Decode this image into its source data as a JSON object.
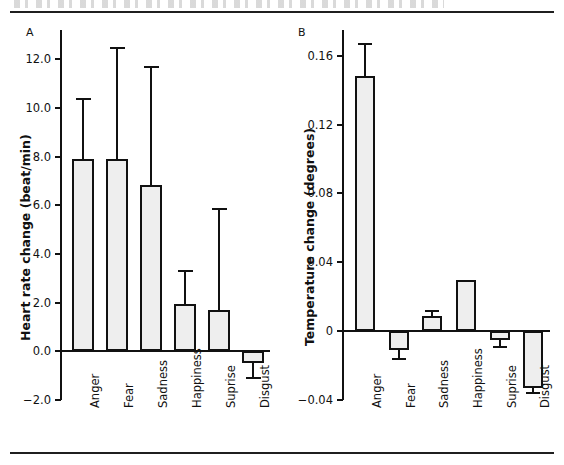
{
  "figure": {
    "panel_a_letter": "A",
    "panel_b_letter": "B"
  },
  "chart_data": [
    {
      "type": "bar",
      "panel": "A",
      "title": "",
      "xlabel": "",
      "ylabel": "Heart rate change (beat/min)",
      "ylim": [
        -2.0,
        13.2
      ],
      "yticks": [
        12.0,
        10.0,
        8.0,
        6.0,
        4.0,
        2.0,
        0.0,
        -2.0
      ],
      "yticklabels": [
        "12.0",
        "10.0",
        "8.0",
        "6.0",
        "4.0",
        "2.0",
        "0.0",
        "−2.0"
      ],
      "grid": false,
      "legend": "none",
      "categories": [
        "Anger",
        "Fear",
        "Sadness",
        "Happiness",
        "Suprise",
        "Disgust"
      ],
      "values": [
        7.9,
        7.9,
        6.85,
        1.95,
        1.7,
        -0.5
      ],
      "error_upper": [
        10.35,
        12.45,
        11.7,
        3.3,
        5.85,
        -0.5
      ],
      "error_lower": [
        7.9,
        7.9,
        6.85,
        1.95,
        1.7,
        -1.1
      ]
    },
    {
      "type": "bar",
      "panel": "B",
      "title": "",
      "xlabel": "",
      "ylabel": "Temperature change (degrees)",
      "ylim": [
        -0.04,
        0.175
      ],
      "yticks": [
        0.16,
        0.12,
        0.08,
        0.04,
        0,
        -0.04
      ],
      "yticklabels": [
        "0.16",
        "0.12",
        "0.08",
        "0.04",
        "0",
        "−0.04"
      ],
      "grid": false,
      "legend": "none",
      "categories": [
        "Anger",
        "Fear",
        "Sadness",
        "Happiness",
        "Suprise",
        "Disgust"
      ],
      "values": [
        0.148,
        -0.011,
        0.009,
        0.03,
        -0.005,
        -0.033
      ],
      "error_upper": [
        0.167,
        -0.011,
        0.012,
        0.03,
        -0.005,
        -0.033
      ],
      "error_lower": [
        0.148,
        -0.016,
        0.009,
        0.03,
        -0.009,
        -0.036
      ]
    }
  ]
}
